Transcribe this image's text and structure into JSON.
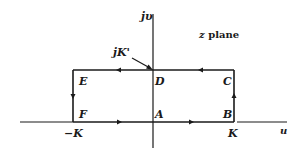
{
  "diagram": {
    "title": "z plane",
    "title_var": "z",
    "title_word": "plane",
    "axes": {
      "vertical_label": "jυ",
      "horizontal_label": "u"
    },
    "annotation": {
      "label": "jK'",
      "points_to": "D"
    },
    "points": {
      "A": "A",
      "B": "B",
      "C": "C",
      "D": "D",
      "E": "E",
      "F": "F"
    },
    "ticks": {
      "neg_k": "−K",
      "pos_k": "K"
    },
    "path_order": [
      "A",
      "B",
      "C",
      "D",
      "E",
      "F",
      "A"
    ],
    "colors": {
      "line": "#1a1a1a",
      "background": "#ffffff"
    }
  }
}
